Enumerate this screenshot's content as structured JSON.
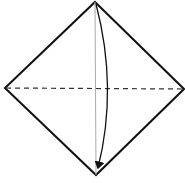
{
  "diagram": {
    "type": "origami-fold-step",
    "colors": {
      "line": "#111111",
      "crease": "#999999",
      "background": "#ffffff"
    },
    "vertices": {
      "top": [
        95,
        2
      ],
      "left": [
        5,
        88
      ],
      "right": [
        184,
        89
      ],
      "bottom": [
        96,
        175
      ]
    },
    "fold_line": {
      "style": "dashed",
      "from": "left",
      "to": "right"
    },
    "crease_line": {
      "style": "thin-solid",
      "from": "top",
      "to": "bottom"
    },
    "arrow": {
      "from": "top",
      "to": "bottom",
      "curve": "right"
    }
  }
}
